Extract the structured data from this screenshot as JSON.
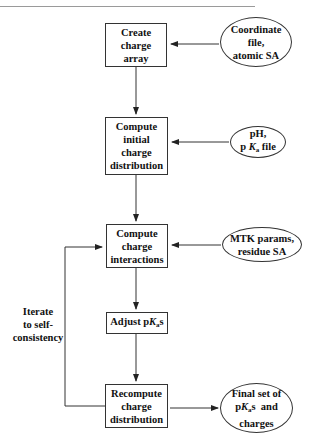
{
  "diagram": {
    "boxes": [
      {
        "id": "create-charge-array",
        "text": "Create\ncharge\narray"
      },
      {
        "id": "compute-initial-charge-distribution",
        "text": "Compute\ninitial\ncharge\ndistribution"
      },
      {
        "id": "compute-charge-interactions",
        "text": "Compute\ncharge\ninteractions"
      },
      {
        "id": "adjust-pkas",
        "pre": "Adjust p",
        "k": "K",
        "sub": "a",
        "post": "s"
      },
      {
        "id": "recompute-charge-distribution",
        "text": "Recompute\ncharge\ndistribution"
      }
    ],
    "inputs": [
      {
        "id": "coordinate-file",
        "text": "Coordinate\nfile,\natomic SA"
      },
      {
        "id": "ph-pka-file",
        "line1": "pH,",
        "pre": "p ",
        "k": "K",
        "sub": "a",
        "post": " file"
      },
      {
        "id": "mtk-params",
        "text": "MTK params,\nresidue SA"
      },
      {
        "id": "final-output",
        "line1": "Final set of",
        "pre": "p",
        "k": "K",
        "sub": "a",
        "post": "s  and",
        "line3": "charges"
      }
    ],
    "loop_label": "Iterate\nto self-\nconsistency"
  },
  "colors": {
    "line": "#333333",
    "background": "#ffffff",
    "rule": "#9a9a9a"
  }
}
